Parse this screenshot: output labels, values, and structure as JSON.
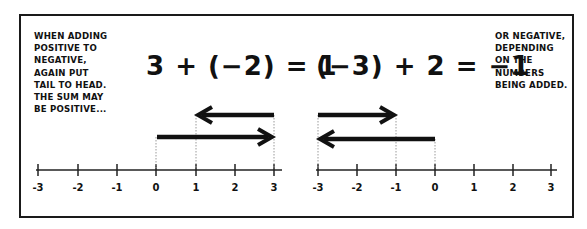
{
  "notes": {
    "left": "WHEN ADDING\nPOSITIVE TO\nNEGATIVE,\nAGAIN PUT\nTAIL TO HEAD.\nTHE SUM MAY\nBE POSITIVE...",
    "right": "OR NEGATIVE,\nDEPENDING\nON THE\nNUMBERS\nBEING ADDED."
  },
  "equations": {
    "left": "3 + (−2) = 1",
    "right": "(−3) + 2 = −1"
  },
  "number_lines": {
    "left": {
      "ticks": [
        "-3",
        "-2",
        "-1",
        "0",
        "1",
        "2",
        "3"
      ],
      "arrows": [
        {
          "from": 0,
          "to": 3,
          "direction": "right",
          "label": "3"
        },
        {
          "from": 3,
          "to": 1,
          "direction": "left",
          "label": "-2"
        }
      ],
      "result": 1
    },
    "right": {
      "ticks": [
        "-3",
        "-2",
        "-1",
        "0",
        "1",
        "2",
        "3"
      ],
      "arrows": [
        {
          "from": 0,
          "to": -3,
          "direction": "left",
          "label": "-3"
        },
        {
          "from": -3,
          "to": -1,
          "direction": "right",
          "label": "2"
        }
      ],
      "result": -1
    }
  },
  "colors": {
    "ink": "#111111",
    "background": "#ffffff",
    "guide": "#9a9a9a"
  }
}
